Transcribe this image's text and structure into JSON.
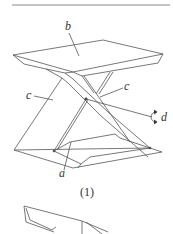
{
  "figure": {
    "caption": "(1)",
    "labels": {
      "a": "a",
      "b": "b",
      "c_left": "c",
      "c_right": "c",
      "d": "d"
    },
    "icons": {
      "rotation": "rotation-arrow-icon"
    },
    "colors": {
      "stroke": "#555555",
      "text": "#333333",
      "background": "#ffffff"
    }
  }
}
